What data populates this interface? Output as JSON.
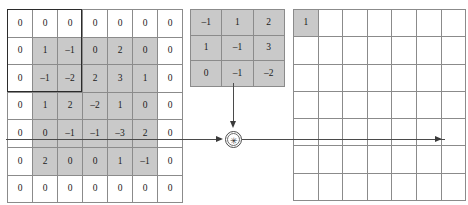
{
  "diagram": {
    "operator_symbol": "✳",
    "operator_name": "convolution-operator",
    "colors": {
      "cell_shaded": "#c9c9c9",
      "cell_plain": "#ffffff",
      "grid_line": "#8b8b8b",
      "window_outline": "#2b2b2b",
      "wire": "#4a4a4a"
    }
  },
  "input_matrix": {
    "name": "padded-input-matrix",
    "rows": 7,
    "cols": 7,
    "values": [
      [
        "0",
        "0",
        "0",
        "0",
        "0",
        "0",
        "0"
      ],
      [
        "0",
        "1",
        "–1",
        "0",
        "2",
        "0",
        "0"
      ],
      [
        "0",
        "–1",
        "–2",
        "2",
        "3",
        "1",
        "0"
      ],
      [
        "0",
        "1",
        "2",
        "–2",
        "1",
        "0",
        "0"
      ],
      [
        "0",
        "0",
        "–1",
        "–1",
        "–3",
        "2",
        "0"
      ],
      [
        "0",
        "2",
        "0",
        "0",
        "1",
        "–1",
        "0"
      ],
      [
        "0",
        "0",
        "0",
        "0",
        "0",
        "0",
        "0"
      ]
    ],
    "shaded": [
      [
        false,
        false,
        false,
        false,
        false,
        false,
        false
      ],
      [
        false,
        true,
        true,
        true,
        true,
        true,
        false
      ],
      [
        false,
        true,
        true,
        true,
        true,
        true,
        false
      ],
      [
        false,
        true,
        true,
        true,
        true,
        true,
        false
      ],
      [
        false,
        true,
        true,
        true,
        true,
        true,
        false
      ],
      [
        false,
        true,
        true,
        true,
        true,
        true,
        false
      ],
      [
        false,
        false,
        false,
        false,
        false,
        false,
        false
      ]
    ],
    "window_box": {
      "name": "convolution-window-outline",
      "top_row": 0,
      "left_col": 0,
      "rows": 3,
      "cols": 3
    }
  },
  "kernel_matrix": {
    "name": "convolution-kernel",
    "rows": 3,
    "cols": 3,
    "values": [
      [
        "–1",
        "1",
        "2"
      ],
      [
        "1",
        "–1",
        "3"
      ],
      [
        "0",
        "–1",
        "–2"
      ]
    ],
    "shaded": [
      [
        true,
        true,
        true
      ],
      [
        true,
        true,
        true
      ],
      [
        true,
        true,
        true
      ]
    ]
  },
  "output_matrix": {
    "name": "output-matrix",
    "rows": 7,
    "cols": 7,
    "values": [
      [
        "1",
        "",
        "",
        "",
        "",
        "",
        ""
      ],
      [
        "",
        "",
        "",
        "",
        "",
        "",
        ""
      ],
      [
        "",
        "",
        "",
        "",
        "",
        "",
        ""
      ],
      [
        "",
        "",
        "",
        "",
        "",
        "",
        ""
      ],
      [
        "",
        "",
        "",
        "",
        "",
        "",
        ""
      ],
      [
        "",
        "",
        "",
        "",
        "",
        "",
        ""
      ],
      [
        "",
        "",
        "",
        "",
        "",
        "",
        ""
      ]
    ],
    "shaded": [
      [
        true,
        false,
        false,
        false,
        false,
        false,
        false
      ],
      [
        false,
        false,
        false,
        false,
        false,
        false,
        false
      ],
      [
        false,
        false,
        false,
        false,
        false,
        false,
        false
      ],
      [
        false,
        false,
        false,
        false,
        false,
        false,
        false
      ],
      [
        false,
        false,
        false,
        false,
        false,
        false,
        false
      ],
      [
        false,
        false,
        false,
        false,
        false,
        false,
        false
      ],
      [
        false,
        false,
        false,
        false,
        false,
        false,
        false
      ]
    ]
  }
}
